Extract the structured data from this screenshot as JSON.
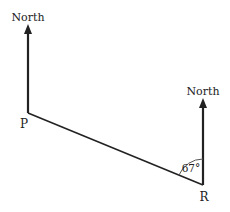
{
  "diagram": {
    "points": {
      "P": {
        "label": "P",
        "x": 28,
        "y": 113
      },
      "R": {
        "label": "R",
        "x": 203,
        "y": 185
      }
    },
    "north_labels": {
      "left": "North",
      "right": "North"
    },
    "angle": {
      "label": "67°",
      "at": "R",
      "between": [
        "North",
        "RP"
      ]
    },
    "colors": {
      "line": "#222222",
      "arc": "#555555",
      "background": "#ffffff"
    }
  }
}
